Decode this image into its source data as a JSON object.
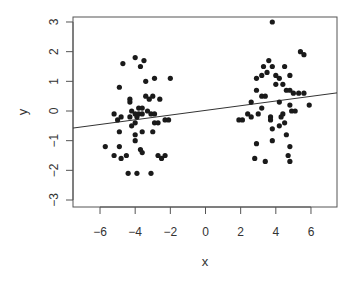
{
  "chart_data": {
    "type": "scatter",
    "title": "",
    "xlabel": "x",
    "ylabel": "y",
    "xlim": [
      -7.5,
      7.5
    ],
    "ylim": [
      -3.2,
      3.2
    ],
    "x_ticks": [
      -6,
      -4,
      -2,
      0,
      2,
      4,
      6
    ],
    "y_ticks": [
      -3,
      -2,
      -1,
      0,
      1,
      2,
      3
    ],
    "grid": false,
    "legend": null,
    "series": [
      {
        "name": "points",
        "marker": "filled-circle",
        "color": "#1a1a1a",
        "points": [
          [
            -4.7,
            1.6
          ],
          [
            -4.0,
            1.8
          ],
          [
            -3.5,
            1.7
          ],
          [
            -3.7,
            1.5
          ],
          [
            -4.9,
            0.8
          ],
          [
            -3.4,
            1.0
          ],
          [
            -2.9,
            1.1
          ],
          [
            -2.0,
            1.1
          ],
          [
            -4.3,
            0.4
          ],
          [
            -3.4,
            0.5
          ],
          [
            -3.2,
            0.4
          ],
          [
            -3.0,
            0.5
          ],
          [
            -2.6,
            0.4
          ],
          [
            -4.3,
            0.3
          ],
          [
            -3.8,
            0.1
          ],
          [
            -3.6,
            0.1
          ],
          [
            -4.2,
            0.0
          ],
          [
            -3.3,
            0.0
          ],
          [
            -4.0,
            -0.1
          ],
          [
            -3.8,
            -0.1
          ],
          [
            -3.6,
            -0.1
          ],
          [
            -3.1,
            -0.1
          ],
          [
            -2.9,
            -0.1
          ],
          [
            -5.2,
            -0.1
          ],
          [
            -4.8,
            -0.2
          ],
          [
            -4.3,
            -0.2
          ],
          [
            -3.9,
            -0.2
          ],
          [
            -5.0,
            -0.3
          ],
          [
            -4.0,
            -0.4
          ],
          [
            -2.9,
            -0.4
          ],
          [
            -2.7,
            -0.4
          ],
          [
            -2.3,
            -0.3
          ],
          [
            -2.1,
            -0.3
          ],
          [
            -4.2,
            -0.5
          ],
          [
            -4.9,
            -0.7
          ],
          [
            -3.6,
            -0.7
          ],
          [
            -3.0,
            -0.7
          ],
          [
            -4.0,
            -0.8
          ],
          [
            -4.0,
            -1.0
          ],
          [
            -5.7,
            -1.2
          ],
          [
            -4.9,
            -1.2
          ],
          [
            -3.7,
            -1.3
          ],
          [
            -3.6,
            -1.4
          ],
          [
            -5.2,
            -1.5
          ],
          [
            -4.8,
            -1.6
          ],
          [
            -4.5,
            -1.5
          ],
          [
            -2.7,
            -1.5
          ],
          [
            -2.5,
            -1.6
          ],
          [
            -2.3,
            -1.5
          ],
          [
            -4.4,
            -2.1
          ],
          [
            -3.9,
            -2.1
          ],
          [
            -3.1,
            -2.1
          ],
          [
            3.8,
            3.0
          ],
          [
            5.4,
            2.0
          ],
          [
            5.6,
            1.9
          ],
          [
            3.6,
            1.7
          ],
          [
            3.3,
            1.5
          ],
          [
            3.8,
            1.5
          ],
          [
            4.5,
            1.5
          ],
          [
            3.2,
            1.2
          ],
          [
            3.5,
            1.3
          ],
          [
            2.9,
            1.1
          ],
          [
            4.0,
            1.2
          ],
          [
            4.2,
            1.1
          ],
          [
            4.8,
            1.2
          ],
          [
            4.0,
            0.9
          ],
          [
            4.4,
            0.9
          ],
          [
            4.6,
            0.7
          ],
          [
            4.8,
            0.7
          ],
          [
            5.0,
            0.6
          ],
          [
            5.3,
            0.6
          ],
          [
            5.6,
            0.6
          ],
          [
            2.9,
            0.7
          ],
          [
            3.2,
            0.5
          ],
          [
            3.4,
            0.5
          ],
          [
            2.6,
            0.3
          ],
          [
            3.2,
            0.1
          ],
          [
            4.2,
            0.3
          ],
          [
            4.8,
            0.2
          ],
          [
            4.9,
            0.0
          ],
          [
            5.1,
            0.0
          ],
          [
            5.9,
            0.2
          ],
          [
            4.4,
            -0.1
          ],
          [
            2.4,
            -0.1
          ],
          [
            1.9,
            -0.3
          ],
          [
            2.1,
            -0.3
          ],
          [
            2.6,
            -0.2
          ],
          [
            3.0,
            -0.1
          ],
          [
            3.7,
            -0.2
          ],
          [
            3.7,
            -0.3
          ],
          [
            4.3,
            -0.2
          ],
          [
            4.5,
            -0.4
          ],
          [
            4.2,
            -0.5
          ],
          [
            3.8,
            -0.6
          ],
          [
            4.6,
            -0.8
          ],
          [
            2.9,
            -1.1
          ],
          [
            3.8,
            -1.0
          ],
          [
            4.8,
            -1.2
          ],
          [
            2.8,
            -1.6
          ],
          [
            3.4,
            -1.7
          ],
          [
            4.7,
            -1.5
          ],
          [
            4.8,
            -1.7
          ]
        ]
      }
    ],
    "fit_line": {
      "type": "linear",
      "intercept": 0.02,
      "slope": 0.079,
      "color": "#333333"
    }
  },
  "labels": {
    "xlabel": "x",
    "ylabel": "y",
    "x_ticks": [
      "−6",
      "−4",
      "−2",
      "0",
      "2",
      "4",
      "6"
    ],
    "y_ticks": [
      "−3",
      "−2",
      "−1",
      "0",
      "1",
      "2",
      "3"
    ]
  }
}
